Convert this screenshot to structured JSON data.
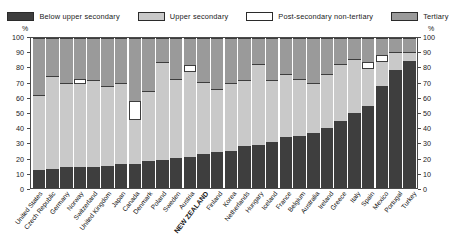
{
  "legend": {
    "items": [
      {
        "label": "Below upper secondary",
        "color": "#3e3e3e",
        "swatch": "legend-swatch-below-upper-secondary"
      },
      {
        "label": "Upper secondary",
        "color": "#c9c9c9",
        "swatch": "legend-swatch-upper-secondary"
      },
      {
        "label": "Post-secondary non-tertiary",
        "color": "#ffffff",
        "swatch": "legend-swatch-post-secondary-non-tertiary"
      },
      {
        "label": "Tertiary",
        "color": "#9a9a9a",
        "swatch": "legend-swatch-tertiary"
      }
    ]
  },
  "axis": {
    "unit_left": "%",
    "unit_right": "%",
    "ticks": [
      "100",
      "90",
      "80",
      "70",
      "60",
      "50",
      "40",
      "30",
      "20",
      "10",
      "0"
    ]
  },
  "chart_data": {
    "type": "bar",
    "title": "",
    "subtitle": "",
    "xlabel": "",
    "ylabel": "%",
    "ylim": [
      0,
      100
    ],
    "stacked": true,
    "stack_total": 100,
    "grid": false,
    "legend_position": "top",
    "categories": [
      "United States",
      "Czech Republic",
      "Germany",
      "Norway",
      "Switzerland",
      "United Kingdom",
      "Japan",
      "Canada",
      "Denmark",
      "Poland",
      "Sweden",
      "Austria",
      "NEW ZEALAND",
      "Finland",
      "Korea",
      "Netherlands",
      "Hungary",
      "Iceland",
      "France",
      "Belgium",
      "Australia",
      "Ireland",
      "Greece",
      "Italy",
      "Spain",
      "Mexico",
      "Portugal",
      "Turkey"
    ],
    "series": [
      {
        "name": "Below upper secondary",
        "color": "#3e3e3e",
        "values": [
          12,
          13,
          14,
          14,
          14,
          15,
          16,
          16,
          18,
          19,
          20,
          21,
          23,
          24,
          25,
          28,
          29,
          31,
          34,
          35,
          37,
          40,
          45,
          50,
          55,
          68,
          79,
          85
        ]
      },
      {
        "name": "Upper secondary",
        "color": "#c9c9c9",
        "values": [
          50,
          62,
          56,
          56,
          58,
          53,
          54,
          30,
          47,
          65,
          53,
          57,
          48,
          42,
          45,
          44,
          54,
          41,
          42,
          38,
          33,
          36,
          38,
          36,
          25,
          17,
          12,
          6
        ]
      },
      {
        "name": "Post-secondary non-tertiary",
        "color": "#ffffff",
        "values": [
          0,
          0,
          0,
          3,
          0,
          0,
          0,
          12,
          0,
          0,
          0,
          4,
          0,
          0,
          0,
          0,
          0,
          0,
          0,
          0,
          0,
          0,
          0,
          0,
          4,
          4,
          0,
          0
        ]
      },
      {
        "name": "Tertiary",
        "color": "#9a9a9a",
        "values": [
          38,
          25,
          30,
          27,
          28,
          32,
          30,
          42,
          35,
          16,
          27,
          18,
          29,
          34,
          30,
          28,
          17,
          28,
          24,
          27,
          30,
          24,
          17,
          14,
          16,
          11,
          9,
          9
        ]
      }
    ]
  }
}
